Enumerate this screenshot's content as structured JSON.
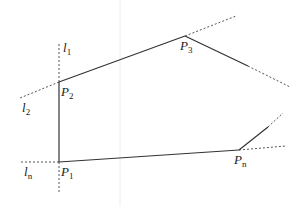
{
  "diagram": {
    "colors": {
      "stroke": "#333333",
      "dashed": "#555555",
      "faint_grid": "#eeeeee",
      "text": "#222222"
    },
    "points": [
      {
        "id": "P1",
        "base": "P",
        "sub": "1",
        "x": 59,
        "y": 162,
        "label_x": 61,
        "label_y": 176
      },
      {
        "id": "P2",
        "base": "P",
        "sub": "2",
        "x": 59,
        "y": 82,
        "label_x": 61,
        "label_y": 96
      },
      {
        "id": "P3",
        "base": "P",
        "sub": "3",
        "x": 185,
        "y": 36,
        "label_x": 180,
        "label_y": 50
      },
      {
        "id": "Pn",
        "base": "P",
        "sub": "n",
        "x": 239,
        "y": 150,
        "label_x": 234,
        "label_y": 164
      }
    ],
    "lines": [
      {
        "id": "l1",
        "base": "l",
        "sub": "1",
        "label_x": 63,
        "label_y": 52
      },
      {
        "id": "l2",
        "base": "l",
        "sub": "2",
        "label_x": 22,
        "label_y": 112
      },
      {
        "id": "ln",
        "base": "l",
        "sub": "n",
        "label_x": 24,
        "label_y": 176
      }
    ],
    "solid_edges": [
      [
        59,
        162,
        59,
        82
      ],
      [
        59,
        82,
        185,
        36
      ],
      [
        185,
        36,
        248,
        66
      ],
      [
        59,
        162,
        239,
        150
      ],
      [
        239,
        150,
        268,
        127
      ]
    ],
    "dashed_edges": [
      [
        59,
        82,
        59,
        44
      ],
      [
        59,
        82,
        20,
        98
      ],
      [
        59,
        162,
        20,
        162
      ],
      [
        59,
        162,
        59,
        193
      ],
      [
        185,
        36,
        236,
        16
      ],
      [
        248,
        66,
        290,
        87
      ],
      [
        268,
        127,
        283,
        113
      ],
      [
        239,
        150,
        286,
        146
      ]
    ],
    "grid_x": 120
  }
}
